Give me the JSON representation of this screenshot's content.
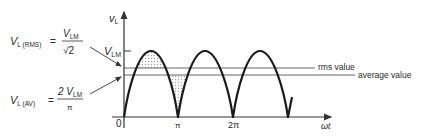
{
  "diagram": {
    "y_axis_label": "v",
    "y_axis_subscript": "L",
    "x_axis_label": "ωt",
    "peak_label": "V",
    "peak_subscript": "LM",
    "origin_label": "0",
    "ticks": [
      "π",
      "2π"
    ],
    "rms_line_label": "rms value",
    "avg_line_label": "average value",
    "rms_formula": {
      "lhs": "V",
      "lhs_subscript": "L (RMS)",
      "equals": "=",
      "numerator": "V",
      "numerator_subscript": "LM",
      "denominator": "√2"
    },
    "avg_formula": {
      "lhs": "V",
      "lhs_subscript": "L (AV)",
      "equals": "=",
      "numerator": "2 V",
      "numerator_subscript": "LM",
      "denominator": "π"
    },
    "colors": {
      "waveform": "#1a1a1a",
      "axes": "#333333",
      "reference_lines": "#555555",
      "shading": "#bdbdbd"
    }
  }
}
